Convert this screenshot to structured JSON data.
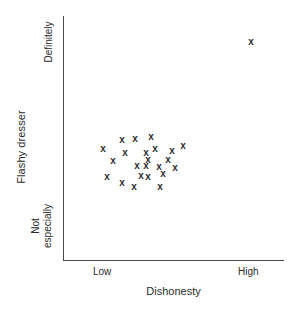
{
  "chart_data": {
    "type": "scatter",
    "title": "",
    "xlabel": "Dishonesty",
    "ylabel": "Flashy dresser",
    "x_tick_labels": [
      "Low",
      "High"
    ],
    "y_tick_labels": [
      "Definitely",
      "Not especially"
    ],
    "grid": false,
    "legend": null,
    "xlim": [
      0,
      1
    ],
    "ylim": [
      0,
      1
    ],
    "marker": "x",
    "marker_color": "#2f2f2f",
    "axis_color": "#4a4a4a",
    "background_color": "#ffffff",
    "n_points": 24,
    "note": "One far outlier at high dishonesty / definitely flashy; remaining 23 points form a low-dishonesty, mid-flashiness cluster.",
    "points": [
      {
        "label": "outlier",
        "px": 251,
        "py": 41,
        "x": 0.85,
        "y": 0.9
      },
      {
        "label": "p1",
        "px": 103,
        "py": 148,
        "x": 0.18,
        "y": 0.46
      },
      {
        "label": "p2",
        "px": 122,
        "py": 139,
        "x": 0.27,
        "y": 0.5
      },
      {
        "label": "p3",
        "px": 135,
        "py": 138,
        "x": 0.33,
        "y": 0.5
      },
      {
        "label": "p4",
        "px": 151,
        "py": 136,
        "x": 0.4,
        "y": 0.51
      },
      {
        "label": "p5",
        "px": 125,
        "py": 152,
        "x": 0.28,
        "y": 0.44
      },
      {
        "label": "p6",
        "px": 146,
        "py": 152,
        "x": 0.38,
        "y": 0.44
      },
      {
        "label": "p7",
        "px": 155,
        "py": 148,
        "x": 0.42,
        "y": 0.46
      },
      {
        "label": "p8",
        "px": 172,
        "py": 150,
        "x": 0.49,
        "y": 0.45
      },
      {
        "label": "p9",
        "px": 183,
        "py": 145,
        "x": 0.54,
        "y": 0.47
      },
      {
        "label": "p10",
        "px": 113,
        "py": 160,
        "x": 0.23,
        "y": 0.41
      },
      {
        "label": "p11",
        "px": 137,
        "py": 165,
        "x": 0.34,
        "y": 0.39
      },
      {
        "label": "p12",
        "px": 146,
        "py": 165,
        "x": 0.38,
        "y": 0.39
      },
      {
        "label": "p13",
        "px": 159,
        "py": 166,
        "x": 0.43,
        "y": 0.38
      },
      {
        "label": "p14",
        "px": 175,
        "py": 167,
        "x": 0.51,
        "y": 0.38
      },
      {
        "label": "p15",
        "px": 107,
        "py": 176,
        "x": 0.2,
        "y": 0.34
      },
      {
        "label": "p16",
        "px": 122,
        "py": 182,
        "x": 0.27,
        "y": 0.32
      },
      {
        "label": "p17",
        "px": 134,
        "py": 186,
        "x": 0.33,
        "y": 0.3
      },
      {
        "label": "p18",
        "px": 148,
        "py": 176,
        "x": 0.39,
        "y": 0.34
      },
      {
        "label": "p19",
        "px": 160,
        "py": 186,
        "x": 0.45,
        "y": 0.3
      },
      {
        "label": "p20",
        "px": 163,
        "py": 173,
        "x": 0.46,
        "y": 0.35
      },
      {
        "label": "p21",
        "px": 148,
        "py": 159,
        "x": 0.39,
        "y": 0.41
      },
      {
        "label": "p22",
        "px": 141,
        "py": 175,
        "x": 0.36,
        "y": 0.34
      },
      {
        "label": "p23",
        "px": 168,
        "py": 159,
        "x": 0.48,
        "y": 0.41
      }
    ]
  },
  "axis": {
    "y_title": "Flashy dresser",
    "x_title": "Dishonesty",
    "y_tick_top": "Definitely",
    "y_tick_bottom_line1": "Not",
    "y_tick_bottom_line2": "especially",
    "x_tick_left": "Low",
    "x_tick_right": "High"
  }
}
